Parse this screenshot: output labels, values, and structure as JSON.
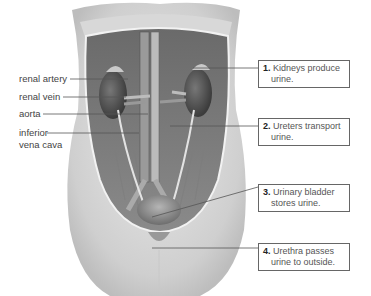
{
  "figure": {
    "left_labels": [
      {
        "text": "renal artery"
      },
      {
        "text": "renal vein"
      },
      {
        "text": "aorta"
      },
      {
        "text": "inferior",
        "text2": "vena cava"
      }
    ],
    "callouts": [
      {
        "num": "1.",
        "line1": "Kidneys produce",
        "line2": "urine."
      },
      {
        "num": "2.",
        "line1": "Ureters transport",
        "line2": "urine."
      },
      {
        "num": "3.",
        "line1": "Urinary bladder",
        "line2": "stores urine."
      },
      {
        "num": "4.",
        "line1": "Urethra passes",
        "line2": "urine to outside."
      }
    ]
  }
}
